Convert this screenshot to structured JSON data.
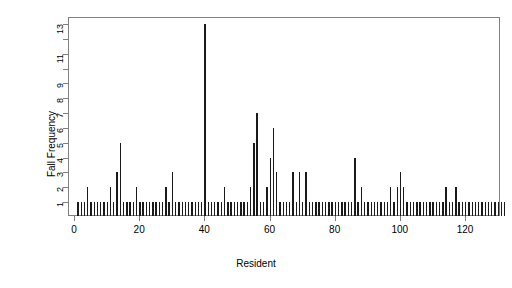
{
  "chart_data": {
    "type": "bar",
    "title": "",
    "xlabel": "Resident",
    "ylabel": "Fall Frequency",
    "xlim": [
      0,
      133
    ],
    "ylim": [
      0,
      13
    ],
    "grid": false,
    "legend": null,
    "x_ticks": [
      0,
      20,
      40,
      60,
      80,
      100,
      120
    ],
    "x_tick_labels": [
      "0",
      "20",
      "40",
      "60",
      "80",
      "100",
      "120"
    ],
    "y_ticks": [
      1,
      2,
      3,
      4,
      5,
      6,
      7,
      8,
      9,
      10,
      11,
      12,
      13
    ],
    "y_tick_labels": [
      "1",
      "2",
      "3",
      "4",
      "5",
      "6",
      "7",
      "8",
      "9",
      "",
      "11",
      "",
      "13"
    ],
    "bar_color": "#1a1a1a",
    "axis_color": "#808080",
    "x": [
      1,
      2,
      3,
      4,
      5,
      6,
      7,
      8,
      9,
      10,
      11,
      12,
      13,
      14,
      15,
      16,
      17,
      18,
      19,
      20,
      21,
      22,
      23,
      24,
      25,
      26,
      27,
      28,
      29,
      30,
      31,
      32,
      33,
      34,
      35,
      36,
      37,
      38,
      39,
      40,
      41,
      42,
      43,
      44,
      45,
      46,
      47,
      48,
      49,
      50,
      51,
      52,
      53,
      54,
      55,
      56,
      57,
      58,
      59,
      60,
      61,
      62,
      63,
      64,
      65,
      66,
      67,
      68,
      69,
      70,
      71,
      72,
      73,
      74,
      75,
      76,
      77,
      78,
      79,
      80,
      81,
      82,
      83,
      84,
      85,
      86,
      87,
      88,
      89,
      90,
      91,
      92,
      93,
      94,
      95,
      96,
      97,
      98,
      99,
      100,
      101,
      102,
      103,
      104,
      105,
      106,
      107,
      108,
      109,
      110,
      111,
      112,
      113,
      114,
      115,
      116,
      117,
      118,
      119,
      120,
      121,
      122,
      123,
      124,
      125,
      126,
      127,
      128,
      129,
      130,
      131,
      132
    ],
    "values": [
      1,
      1,
      1,
      2,
      1,
      1,
      1,
      1,
      1,
      1,
      2,
      1,
      3,
      5,
      1,
      1,
      1,
      1,
      2,
      1,
      1,
      1,
      1,
      1,
      1,
      1,
      1,
      2,
      1,
      3,
      1,
      1,
      1,
      1,
      1,
      1,
      1,
      1,
      1,
      13,
      1,
      1,
      1,
      1,
      1,
      2,
      1,
      1,
      1,
      1,
      1,
      1,
      1,
      2,
      5,
      7,
      1,
      1,
      2,
      4,
      6,
      3,
      1,
      1,
      1,
      1,
      3,
      1,
      3,
      1,
      3,
      1,
      1,
      1,
      1,
      1,
      1,
      1,
      1,
      1,
      1,
      1,
      1,
      1,
      1,
      4,
      1,
      2,
      1,
      1,
      1,
      1,
      1,
      1,
      1,
      1,
      2,
      1,
      2,
      3,
      2,
      1,
      1,
      1,
      1,
      1,
      1,
      1,
      1,
      1,
      1,
      1,
      1,
      2,
      1,
      1,
      2,
      1,
      1,
      1,
      1,
      1,
      1,
      1,
      1,
      1,
      1,
      1,
      1,
      1,
      1,
      1
    ]
  }
}
